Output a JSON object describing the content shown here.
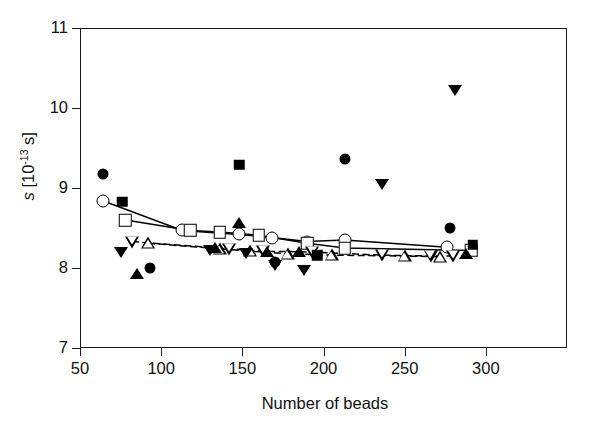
{
  "chart_data": {
    "type": "scatter",
    "title": "",
    "xlabel": "Number of beads",
    "ylabel": "s [10-13 s]",
    "ylabel_parts": {
      "symbol": "s",
      "open": " [10",
      "exponent": "-13",
      "close": " s]"
    },
    "xlim": [
      50,
      350
    ],
    "ylim": [
      7,
      11
    ],
    "xticks": [
      50,
      100,
      150,
      200,
      250,
      300
    ],
    "yticks": [
      7,
      8,
      9,
      10,
      11
    ],
    "grid": false,
    "legend": "none",
    "series": [
      {
        "name": "open-circle",
        "marker": "circle-open",
        "connected": true,
        "line": "solid",
        "points": [
          {
            "x": 64,
            "y": 8.84
          },
          {
            "x": 113,
            "y": 8.47
          },
          {
            "x": 148,
            "y": 8.42
          },
          {
            "x": 168,
            "y": 8.38
          },
          {
            "x": 190,
            "y": 8.33
          },
          {
            "x": 213,
            "y": 8.35
          },
          {
            "x": 276,
            "y": 8.26
          }
        ]
      },
      {
        "name": "open-square",
        "marker": "square-open",
        "connected": true,
        "line": "solid",
        "points": [
          {
            "x": 78,
            "y": 8.6
          },
          {
            "x": 118,
            "y": 8.47
          },
          {
            "x": 136,
            "y": 8.45
          },
          {
            "x": 160,
            "y": 8.41
          },
          {
            "x": 190,
            "y": 8.31
          },
          {
            "x": 213,
            "y": 8.25
          },
          {
            "x": 291,
            "y": 8.22
          }
        ]
      },
      {
        "name": "open-down-triangle",
        "marker": "tri-down-open",
        "connected": true,
        "line": "dashed",
        "points": [
          {
            "x": 82,
            "y": 8.33
          },
          {
            "x": 142,
            "y": 8.24
          },
          {
            "x": 163,
            "y": 8.21
          },
          {
            "x": 193,
            "y": 8.2
          },
          {
            "x": 236,
            "y": 8.16
          },
          {
            "x": 266,
            "y": 8.15
          },
          {
            "x": 280,
            "y": 8.15
          }
        ]
      },
      {
        "name": "open-up-triangle",
        "marker": "tri-up-open",
        "connected": true,
        "line": "dashed",
        "points": [
          {
            "x": 92,
            "y": 8.31
          },
          {
            "x": 136,
            "y": 8.24
          },
          {
            "x": 155,
            "y": 8.21
          },
          {
            "x": 178,
            "y": 8.18
          },
          {
            "x": 205,
            "y": 8.16
          },
          {
            "x": 250,
            "y": 8.15
          },
          {
            "x": 272,
            "y": 8.14
          }
        ]
      },
      {
        "name": "filled-circle",
        "marker": "circle-fill",
        "connected": false,
        "points": [
          {
            "x": 64,
            "y": 9.17
          },
          {
            "x": 93,
            "y": 8.0
          },
          {
            "x": 170,
            "y": 8.08
          },
          {
            "x": 213,
            "y": 9.36
          },
          {
            "x": 278,
            "y": 8.5
          }
        ]
      },
      {
        "name": "filled-square",
        "marker": "square-fill",
        "connected": false,
        "points": [
          {
            "x": 76,
            "y": 8.83
          },
          {
            "x": 148,
            "y": 9.29
          },
          {
            "x": 196,
            "y": 8.16
          },
          {
            "x": 292,
            "y": 8.29
          }
        ]
      },
      {
        "name": "filled-up-triangle",
        "marker": "tri-up-fill",
        "connected": false,
        "points": [
          {
            "x": 85,
            "y": 7.93
          },
          {
            "x": 133,
            "y": 8.25
          },
          {
            "x": 148,
            "y": 8.56
          },
          {
            "x": 165,
            "y": 8.2
          },
          {
            "x": 185,
            "y": 8.2
          },
          {
            "x": 288,
            "y": 8.17
          }
        ]
      },
      {
        "name": "filled-down-triangle",
        "marker": "tri-down-fill",
        "connected": false,
        "points": [
          {
            "x": 75,
            "y": 8.2
          },
          {
            "x": 130,
            "y": 8.23
          },
          {
            "x": 152,
            "y": 8.19
          },
          {
            "x": 170,
            "y": 8.04
          },
          {
            "x": 188,
            "y": 7.97
          },
          {
            "x": 236,
            "y": 9.05
          },
          {
            "x": 281,
            "y": 10.22
          }
        ]
      }
    ]
  }
}
